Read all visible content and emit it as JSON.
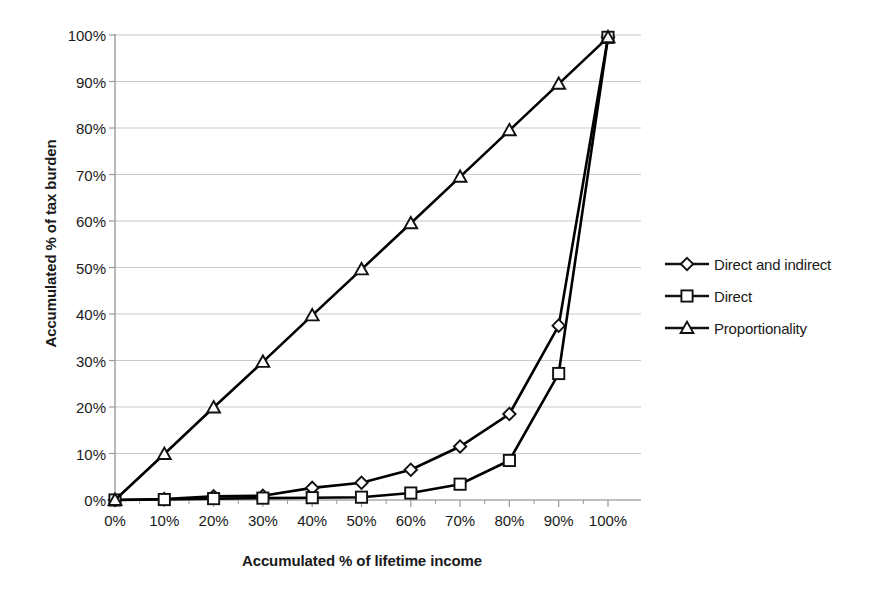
{
  "chart_data": {
    "type": "line",
    "title": "",
    "xlabel": "Accumulated % of lifetime income",
    "ylabel": "Accumulated % of tax burden",
    "x": [
      0,
      10,
      20,
      30,
      40,
      50,
      60,
      70,
      80,
      90,
      100
    ],
    "xtick_labels": [
      "0%",
      "10%",
      "20%",
      "30%",
      "40%",
      "50%",
      "60%",
      "70%",
      "80%",
      "90%",
      "100%"
    ],
    "ytick_labels": [
      "0%",
      "10%",
      "20%",
      "30%",
      "40%",
      "50%",
      "60%",
      "70%",
      "80%",
      "90%",
      "100%"
    ],
    "yticks": [
      0,
      10,
      20,
      30,
      40,
      50,
      60,
      70,
      80,
      90,
      100
    ],
    "xlim": [
      0,
      100
    ],
    "ylim": [
      0,
      100
    ],
    "grid": "horizontal",
    "legend_position": "right",
    "series": [
      {
        "name": "Direct and indirect",
        "marker": "diamond",
        "color": "#000000",
        "values": [
          0,
          0.2,
          0.8,
          0.9,
          2.6,
          3.7,
          6.5,
          11.5,
          18.5,
          37.5,
          99.5
        ]
      },
      {
        "name": "Direct",
        "marker": "square",
        "color": "#000000",
        "values": [
          0,
          0.1,
          0.3,
          0.4,
          0.5,
          0.6,
          1.5,
          3.4,
          8.5,
          27.2,
          99.5
        ]
      },
      {
        "name": "Proportionality",
        "marker": "triangle",
        "color": "#000000",
        "values": [
          0,
          9.9,
          19.9,
          29.7,
          39.7,
          49.6,
          59.5,
          69.5,
          79.5,
          89.5,
          99.5
        ]
      }
    ]
  },
  "legend": {
    "items": [
      {
        "label": "Direct and indirect",
        "marker": "diamond"
      },
      {
        "label": "Direct",
        "marker": "square"
      },
      {
        "label": "Proportionality",
        "marker": "triangle"
      }
    ]
  },
  "axes": {
    "x_title": "Accumulated % of lifetime income",
    "y_title": "Accumulated % of tax burden"
  },
  "colors": {
    "line": "#111111",
    "grid": "#c9c9c9",
    "axis": "#9a9a9a",
    "text": "#1a1a1a",
    "background": "#ffffff"
  }
}
